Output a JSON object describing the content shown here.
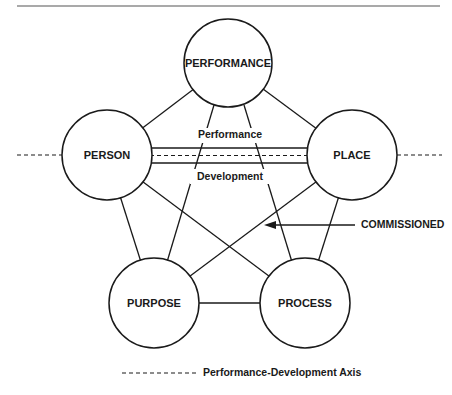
{
  "diagram": {
    "nodes": {
      "performance": {
        "label": "PERFORMANCE"
      },
      "person": {
        "label": "PERSON"
      },
      "place": {
        "label": "PLACE"
      },
      "purpose": {
        "label": "PURPOSE"
      },
      "process": {
        "label": "PROCESS"
      }
    },
    "axis": {
      "upper_label": "Performance",
      "lower_label": "Development"
    },
    "callout": {
      "label": "COMMISSIONED"
    },
    "legend": {
      "label": "Performance-Development Axis"
    },
    "colors": {
      "stroke": "#1a1a1a",
      "background": "#ffffff"
    }
  }
}
